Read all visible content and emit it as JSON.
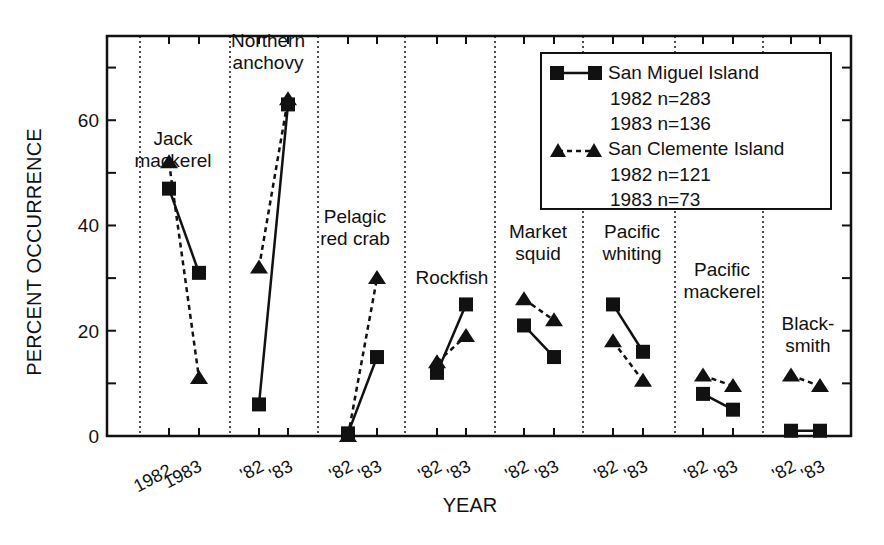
{
  "chart_data": {
    "type": "line",
    "title": "",
    "xlabel": "YEAR",
    "ylabel": "PERCENT OCCURRENCE",
    "ylim": [
      0,
      76
    ],
    "yticks_major": [
      0,
      20,
      40,
      60
    ],
    "yticks_minor": [
      10,
      30,
      50,
      70
    ],
    "grid": "vertical dotted separators between species groups",
    "legend_position": "upper right, inside plot",
    "groups": [
      {
        "species": [
          "Jack",
          "mackerel"
        ],
        "x_labels": [
          "1982",
          "1983"
        ],
        "san_miguel": [
          47,
          31
        ],
        "san_clemente": [
          52,
          11
        ]
      },
      {
        "species": [
          "Northern",
          "anchovy"
        ],
        "x_labels": [
          "'82",
          "'83"
        ],
        "san_miguel": [
          6,
          63
        ],
        "san_clemente": [
          32,
          64
        ]
      },
      {
        "species": [
          "Pelagic",
          "red crab"
        ],
        "x_labels": [
          "'82",
          "'83"
        ],
        "san_miguel": [
          0.5,
          15
        ],
        "san_clemente": [
          0,
          30
        ]
      },
      {
        "species": [
          "Rockfish"
        ],
        "x_labels": [
          "'82",
          "'83"
        ],
        "san_miguel": [
          12,
          25
        ],
        "san_clemente": [
          14,
          19
        ]
      },
      {
        "species": [
          "Market",
          "squid"
        ],
        "x_labels": [
          "'82",
          "'83"
        ],
        "san_miguel": [
          21,
          15
        ],
        "san_clemente": [
          26,
          22
        ]
      },
      {
        "species": [
          "Pacific",
          "whiting"
        ],
        "x_labels": [
          "'82",
          "'83"
        ],
        "san_miguel": [
          25,
          16
        ],
        "san_clemente": [
          18,
          10.5
        ]
      },
      {
        "species": [
          "Pacific",
          "mackerel"
        ],
        "x_labels": [
          "'82",
          "'83"
        ],
        "san_miguel": [
          8,
          5
        ],
        "san_clemente": [
          11.5,
          9.5
        ]
      },
      {
        "species": [
          "Black-",
          "smith"
        ],
        "x_labels": [
          "'82",
          "'83"
        ],
        "san_miguel": [
          1,
          1
        ],
        "san_clemente": [
          11.5,
          9.5
        ]
      }
    ],
    "series": [
      {
        "name": "San Miguel Island",
        "marker": "square",
        "line": "solid",
        "values": [
          [
            47,
            31
          ],
          [
            6,
            63
          ],
          [
            0.5,
            15
          ],
          [
            12,
            25
          ],
          [
            21,
            15
          ],
          [
            25,
            16
          ],
          [
            8,
            5
          ],
          [
            1,
            1
          ]
        ]
      },
      {
        "name": "San Clemente Island",
        "marker": "triangle",
        "line": "dashed",
        "values": [
          [
            52,
            11
          ],
          [
            32,
            64
          ],
          [
            0,
            30
          ],
          [
            14,
            19
          ],
          [
            26,
            22
          ],
          [
            18,
            10.5
          ],
          [
            11.5,
            9.5
          ],
          [
            11.5,
            9.5
          ]
        ]
      }
    ]
  },
  "axes": {
    "ylabel": "PERCENT OCCURRENCE",
    "xlabel": "YEAR"
  },
  "legend": {
    "series1_name": "San Miguel Island",
    "series1_n1982": "1982 n=283",
    "series1_n1983": "1983 n=136",
    "series2_name": "San Clemente Island",
    "series2_n1982": "1982 n=121",
    "series2_n1983": "1983 n=73"
  },
  "colors": {
    "ink": "#111111",
    "background": "#ffffff"
  }
}
